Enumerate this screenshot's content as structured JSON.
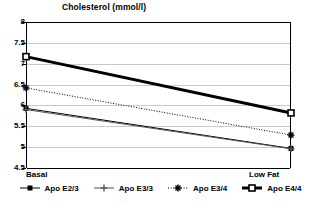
{
  "chart_data": {
    "type": "line",
    "title": "Cholesterol (mmol/l)",
    "xlabel": "",
    "ylabel": "",
    "categories": [
      "Basal",
      "Low Fat"
    ],
    "ylim": [
      4.5,
      8
    ],
    "yticks": [
      "8",
      "7.5",
      "7",
      "6.5",
      "6",
      "5.5",
      "5",
      "4.5"
    ],
    "ytick_values": [
      8,
      7.5,
      7,
      6.5,
      6,
      5.5,
      5,
      4.5
    ],
    "grid": true,
    "legend_position": "bottom",
    "series": [
      {
        "name": "Apo E2/3",
        "values": [
          5.93,
          4.97
        ],
        "marker": "small-square",
        "line_style": "solid",
        "line_width": 1,
        "color": "#000000"
      },
      {
        "name": "Apo E3/3",
        "values": [
          5.9,
          4.96
        ],
        "marker": "plus",
        "line_style": "solid",
        "line_width": 1,
        "color": "#555555"
      },
      {
        "name": "Apo E3/4",
        "values": [
          6.42,
          5.29
        ],
        "marker": "star",
        "line_style": "dotted",
        "line_width": 1,
        "color": "#000000"
      },
      {
        "name": "Apo E4/4",
        "values": [
          7.17,
          5.82
        ],
        "marker": "square",
        "line_style": "solid",
        "line_width": 3,
        "color": "#000000"
      }
    ]
  },
  "axes": {
    "x_labels": [
      "Basal",
      "Low Fat"
    ]
  },
  "legend": {
    "items": [
      {
        "label": "Apo E2/3"
      },
      {
        "label": "Apo E3/3"
      },
      {
        "label": "Apo E3/4"
      },
      {
        "label": "Apo E4/4"
      }
    ]
  }
}
